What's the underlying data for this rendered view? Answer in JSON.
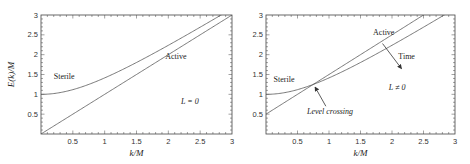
{
  "chart_data": [
    {
      "type": "line",
      "title": "",
      "xlabel": "k/M",
      "ylabel": "E(k)/M",
      "xlim": [
        0,
        3
      ],
      "ylim": [
        0,
        3
      ],
      "xticks": [
        "0.5",
        "1",
        "1.5",
        "2",
        "2.5",
        "3"
      ],
      "yticks": [
        "0.5",
        "1",
        "1.5",
        "2",
        "2.5",
        "3"
      ],
      "xtick_values": [
        0.5,
        1,
        1.5,
        2,
        2.5,
        3
      ],
      "ytick_values": [
        0.5,
        1,
        1.5,
        2,
        2.5,
        3
      ],
      "grid": false,
      "series": [
        {
          "name": "Sterile",
          "formula": "sqrt(1+k^2)",
          "x": [
            0,
            0.5,
            1,
            1.5,
            2,
            2.5,
            2.83
          ],
          "values": [
            1.0,
            1.118,
            1.414,
            1.803,
            2.236,
            2.693,
            3.0
          ]
        },
        {
          "name": "Active",
          "formula": "k",
          "x": [
            0,
            1,
            2,
            3
          ],
          "values": [
            0,
            1,
            2,
            3
          ]
        }
      ],
      "annotations": [
        {
          "text": "Sterile",
          "x": 0.2,
          "y": 1.38
        },
        {
          "text": "Active",
          "x": 1.95,
          "y": 1.9
        },
        {
          "text": "L = 0",
          "x": 2.2,
          "y": 0.75
        }
      ]
    },
    {
      "type": "line",
      "title": "",
      "xlabel": "k/M",
      "ylabel": "",
      "xlim": [
        0,
        3
      ],
      "ylim": [
        0,
        3
      ],
      "xticks": [
        "0.5",
        "1",
        "1.5",
        "2",
        "2.5",
        "3"
      ],
      "yticks": [
        "0.5",
        "1",
        "1.5",
        "2",
        "2.5",
        "3"
      ],
      "xtick_values": [
        0.5,
        1,
        1.5,
        2,
        2.5,
        3
      ],
      "ytick_values": [
        0.5,
        1,
        1.5,
        2,
        2.5,
        3
      ],
      "grid": false,
      "series": [
        {
          "name": "Sterile",
          "formula": "sqrt(1+k^2)",
          "x": [
            0,
            0.5,
            0.75,
            1,
            1.5,
            2,
            2.5,
            2.83
          ],
          "values": [
            1.0,
            1.118,
            1.25,
            1.414,
            1.803,
            2.236,
            2.693,
            3.0
          ]
        },
        {
          "name": "Active",
          "formula": "k+0.5",
          "x": [
            0,
            0.75,
            1,
            2,
            2.5
          ],
          "values": [
            0.5,
            1.25,
            1.5,
            2.5,
            3.0
          ]
        }
      ],
      "annotations": [
        {
          "text": "Sterile",
          "x": 0.12,
          "y": 1.3
        },
        {
          "text": "Active",
          "x": 1.7,
          "y": 2.5
        },
        {
          "text": "Time",
          "x": 2.1,
          "y": 1.9
        },
        {
          "text": "L ≠ 0",
          "x": 1.95,
          "y": 1.1
        },
        {
          "text": "Level crossing",
          "x": 0.65,
          "y": 0.5
        }
      ],
      "arrows": [
        {
          "name": "level-crossing-arrow",
          "from": [
            0.95,
            0.7
          ],
          "to": [
            0.78,
            1.18
          ]
        },
        {
          "name": "time-arrow",
          "from": [
            1.85,
            2.28
          ],
          "to": [
            2.15,
            1.65
          ]
        }
      ]
    }
  ]
}
